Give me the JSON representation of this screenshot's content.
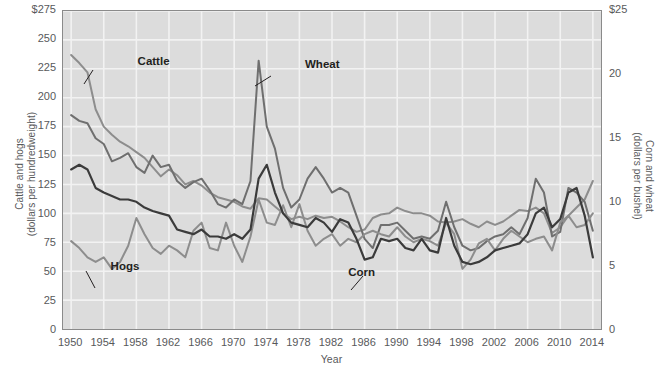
{
  "chart_data": {
    "type": "line",
    "title": "",
    "xlabel": "Year",
    "ylabel_left": "Cattle and hogs\n(dollars per hundredweight)",
    "ylabel_right": "Corn and wheat\n(dollars per bushel)",
    "grid": true,
    "legend_position": "inline-annotations",
    "xlim": [
      1949,
      2015
    ],
    "xticks": [
      1950,
      1954,
      1958,
      1962,
      1966,
      1970,
      1974,
      1978,
      1982,
      1986,
      1990,
      1994,
      1998,
      2002,
      2006,
      2010,
      2014
    ],
    "xtick_labels": [
      "1950",
      "1954",
      "1958",
      "1962",
      "1966",
      "1970",
      "1974",
      "1978",
      "1982",
      "1986",
      "1990",
      "1994",
      "1998",
      "2002",
      "2006",
      "2010",
      "2014"
    ],
    "ylim_left": [
      0,
      275
    ],
    "yticks_left": [
      0,
      25,
      50,
      75,
      100,
      125,
      150,
      175,
      200,
      225,
      250,
      275
    ],
    "ytick_labels_left": [
      "0",
      "25",
      "50",
      "75",
      "100",
      "125",
      "150",
      "175",
      "200",
      "225",
      "250",
      "$275"
    ],
    "ylim_right": [
      0,
      25
    ],
    "yticks_right": [
      0,
      5,
      10,
      15,
      20,
      25
    ],
    "ytick_labels_right": [
      "0",
      "5",
      "10",
      "15",
      "20",
      "$25"
    ],
    "x": [
      1950,
      1951,
      1952,
      1953,
      1954,
      1955,
      1956,
      1957,
      1958,
      1959,
      1960,
      1961,
      1962,
      1963,
      1964,
      1965,
      1966,
      1967,
      1968,
      1969,
      1970,
      1971,
      1972,
      1973,
      1974,
      1975,
      1976,
      1977,
      1978,
      1979,
      1980,
      1981,
      1982,
      1983,
      1984,
      1985,
      1986,
      1987,
      1988,
      1989,
      1990,
      1991,
      1992,
      1993,
      1994,
      1995,
      1996,
      1997,
      1998,
      1999,
      2000,
      2001,
      2002,
      2003,
      2004,
      2005,
      2006,
      2007,
      2008,
      2009,
      2010,
      2011,
      2012,
      2013,
      2014
    ],
    "series": [
      {
        "name": "Cattle",
        "axis": "left",
        "unit": "dollars per hundredweight",
        "color": "#8d8d8d",
        "values": [
          237,
          230,
          222,
          190,
          175,
          168,
          162,
          158,
          153,
          148,
          140,
          132,
          138,
          133,
          125,
          128,
          124,
          118,
          114,
          112,
          110,
          106,
          104,
          113,
          112,
          106,
          100,
          95,
          97,
          95,
          98,
          96,
          97,
          93,
          88,
          84,
          86,
          96,
          99,
          100,
          105,
          102,
          100,
          100,
          98,
          93,
          92,
          93,
          95,
          91,
          88,
          93,
          90,
          93,
          98,
          103,
          102,
          105,
          100,
          83,
          88,
          98,
          105,
          112,
          128
        ]
      },
      {
        "name": "Wheat",
        "axis": "right",
        "unit": "dollars per bushel",
        "color": "#6f6f6f",
        "values": [
          185,
          180,
          178,
          165,
          160,
          145,
          148,
          152,
          140,
          135,
          150,
          140,
          142,
          128,
          122,
          127,
          130,
          120,
          108,
          105,
          112,
          108,
          128,
          232,
          175,
          156,
          122,
          105,
          112,
          130,
          140,
          130,
          118,
          122,
          118,
          98,
          78,
          70,
          90,
          90,
          92,
          85,
          78,
          80,
          78,
          85,
          110,
          88,
          72,
          68,
          70,
          76,
          80,
          82,
          88,
          82,
          96,
          130,
          118,
          80,
          84,
          122,
          118,
          110,
          85
        ]
      },
      {
        "name": "Hogs",
        "axis": "left",
        "unit": "dollars per hundredweight",
        "color": "#8d8d8d",
        "values": [
          76,
          70,
          62,
          58,
          62,
          52,
          58,
          72,
          96,
          82,
          70,
          65,
          72,
          68,
          62,
          85,
          92,
          70,
          68,
          92,
          72,
          58,
          80,
          112,
          92,
          90,
          107,
          88,
          108,
          85,
          72,
          78,
          82,
          72,
          78,
          75,
          82,
          85,
          82,
          80,
          88,
          80,
          75,
          78,
          76,
          72,
          92,
          82,
          52,
          60,
          74,
          78,
          68,
          78,
          85,
          80,
          75,
          78,
          80,
          68,
          92,
          98,
          88,
          90,
          100
        ]
      },
      {
        "name": "Corn",
        "axis": "right",
        "unit": "dollars per bushel",
        "color": "#3b3b3b",
        "values": [
          138,
          142,
          138,
          122,
          118,
          115,
          112,
          112,
          110,
          105,
          102,
          100,
          98,
          86,
          84,
          82,
          86,
          80,
          80,
          78,
          82,
          78,
          86,
          130,
          142,
          118,
          100,
          92,
          90,
          88,
          96,
          92,
          84,
          95,
          92,
          78,
          60,
          62,
          78,
          76,
          78,
          70,
          68,
          78,
          68,
          66,
          96,
          72,
          58,
          56,
          58,
          62,
          68,
          70,
          72,
          74,
          82,
          100,
          105,
          88,
          95,
          118,
          122,
          98,
          62
        ]
      }
    ],
    "annotations": [
      {
        "text": "Cattle",
        "x_pct": 14.0,
        "y_pct": 14.0
      },
      {
        "text": "Wheat",
        "x_pct": 45.0,
        "y_pct": 15.0
      },
      {
        "text": "Hogs",
        "x_pct": 9.0,
        "y_pct": 78.0
      },
      {
        "text": "Corn",
        "x_pct": 53.0,
        "y_pct": 80.0
      }
    ]
  },
  "axes": {
    "x_title": "Year",
    "left_title": "Cattle and hogs (dollars per hundredweight)",
    "left_title_line1": "Cattle and hogs",
    "left_title_line2": "(dollars per hundredweight)",
    "right_title_line1": "Corn and wheat",
    "right_title_line2": "(dollars per bushel)"
  },
  "labels": {
    "cattle": "Cattle",
    "wheat": "Wheat",
    "hogs": "Hogs",
    "corn": "Corn"
  },
  "colors": {
    "plot_background": "#dcdcdc",
    "gridline": "#f2f2f2",
    "axis_border": "#8a8a8a",
    "text": "#58595b",
    "label_text": "#231f20",
    "cattle": "#8d8d8d",
    "wheat": "#6f6f6f",
    "hogs": "#8d8d8d",
    "corn": "#3b3b3b"
  }
}
